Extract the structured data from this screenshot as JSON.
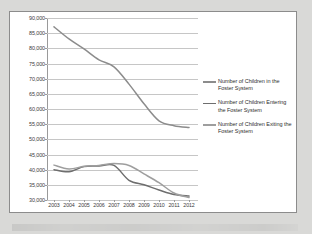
{
  "chart_data": {
    "type": "line",
    "title": "",
    "xlabel": "",
    "ylabel": "",
    "ylim": [
      30000,
      90000
    ],
    "ytick_step": 5000,
    "grid": true,
    "legend_position": "right",
    "categories": [
      "2003",
      "2004",
      "2005",
      "2006",
      "2007",
      "2008",
      "2009",
      "2010",
      "2011",
      "2012"
    ],
    "ytick_labels": [
      "90,000",
      "85,000",
      "80,000",
      "75,000",
      "70,000",
      "65,000",
      "60,000",
      "55,000",
      "50,000",
      "45,000",
      "40,000",
      "35,000",
      "30,000"
    ],
    "series": [
      {
        "name": "Number of Children in the Foster System",
        "color": "#8c8c8c",
        "values": [
          87100,
          83100,
          79800,
          76200,
          73900,
          68200,
          61700,
          56100,
          54500,
          53900
        ]
      },
      {
        "name": "Number of Children Entering the Foster System",
        "color": "#6e6e6e",
        "values": [
          40000,
          39300,
          41000,
          41200,
          41400,
          36500,
          35000,
          33300,
          31800,
          31300
        ]
      },
      {
        "name": "Number of Children Exiting the Foster System",
        "color": "#9e9e9e",
        "values": [
          41500,
          40200,
          41100,
          41400,
          42000,
          41400,
          38600,
          35700,
          32300,
          30800
        ]
      }
    ]
  },
  "legend": {
    "entries": [
      "Number of Children in the Foster System",
      "Number of Children Entering the Foster System",
      "Number of Children Exiting the Foster System"
    ]
  }
}
